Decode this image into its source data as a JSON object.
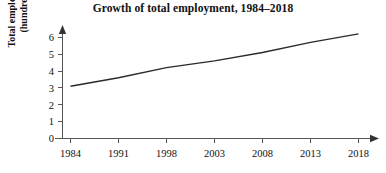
{
  "chart_data": {
    "type": "line",
    "title": "Growth of total employment, 1984–2018",
    "xlabel": "",
    "ylabel": "Total employment (hundreds)",
    "ylabel_line1": "Total employment",
    "ylabel_line2": "(hundreds)",
    "categories": [
      "1984",
      "1991",
      "1998",
      "2003",
      "2008",
      "2013",
      "2018"
    ],
    "x_tick_labels": [
      "1984",
      "1991",
      "1998",
      "2003",
      "2008",
      "2013",
      "2018"
    ],
    "y_tick_labels": [
      "0",
      "1",
      "2",
      "3",
      "4",
      "5",
      "6"
    ],
    "y_tick_values": [
      0,
      1,
      2,
      3,
      4,
      5,
      6
    ],
    "ylim": [
      0,
      6.5
    ],
    "values": [
      3.1,
      3.6,
      4.2,
      4.6,
      5.1,
      5.7,
      6.2
    ],
    "series": [
      {
        "name": "Total employment",
        "values": [
          3.1,
          3.6,
          4.2,
          4.6,
          5.1,
          5.7,
          6.2
        ]
      }
    ],
    "grid": false,
    "legend": false,
    "legend_position": "none",
    "line_color": "#2a2a2a",
    "axis_color": "#555555",
    "background_color": "#ffffff",
    "x_axis_arrow": true,
    "y_axis_arrow": true,
    "annotations": []
  }
}
